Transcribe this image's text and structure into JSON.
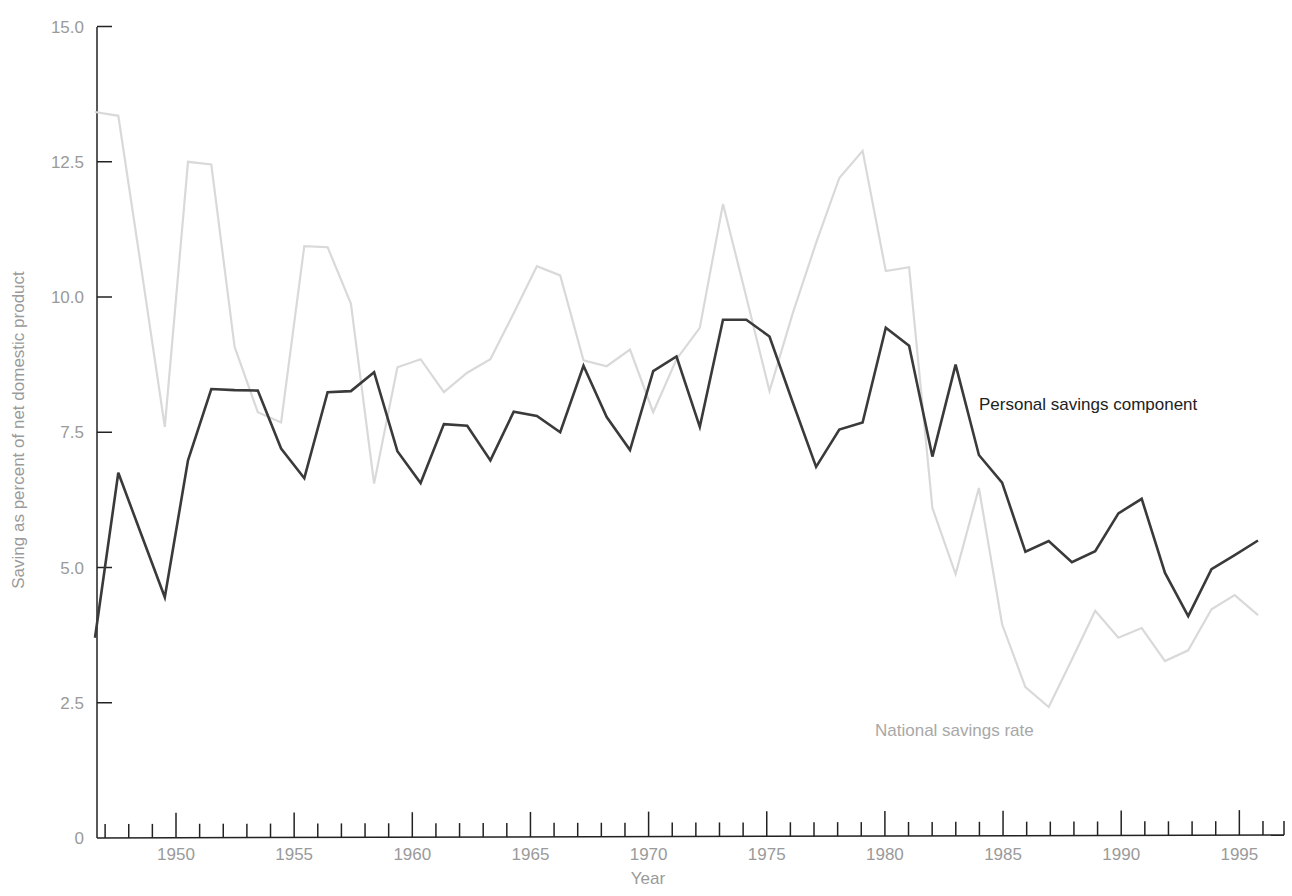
{
  "chart_data": {
    "type": "line",
    "title": "",
    "xlabel": "Year",
    "ylabel": "Saving as percent of net domestic product",
    "ylim": [
      0,
      15
    ],
    "xlim": [
      1946,
      1997
    ],
    "grid": false,
    "legend_position": "inline labels",
    "y_ticks": [
      "0",
      "2.5",
      "5.0",
      "7.5",
      "10.0",
      "12.5",
      "15.0"
    ],
    "y_tick_values": [
      0,
      2.5,
      5,
      7.5,
      10,
      12.5,
      15
    ],
    "x_tick_labels": [
      "1950",
      "1955",
      "1960",
      "1965",
      "1970",
      "1975",
      "1980",
      "1985",
      "1990",
      "1995"
    ],
    "x": [
      1946,
      1947,
      1948,
      1949,
      1950,
      1951,
      1952,
      1953,
      1954,
      1955,
      1956,
      1957,
      1958,
      1959,
      1960,
      1961,
      1962,
      1963,
      1964,
      1965,
      1966,
      1967,
      1968,
      1969,
      1970,
      1971,
      1972,
      1973,
      1974,
      1975,
      1976,
      1977,
      1978,
      1979,
      1980,
      1981,
      1982,
      1983,
      1984,
      1985,
      1986,
      1987,
      1988,
      1989,
      1990,
      1991,
      1992,
      1993,
      1994,
      1995,
      1996
    ],
    "series": [
      {
        "name": "Personal savings component",
        "color": "#3a3a3a",
        "values": [
          3.7,
          6.75,
          5.6,
          4.45,
          6.98,
          8.3,
          8.28,
          8.27,
          7.2,
          6.65,
          8.24,
          8.26,
          8.61,
          7.15,
          6.56,
          7.65,
          7.62,
          6.98,
          7.88,
          7.8,
          7.5,
          8.73,
          7.78,
          7.17,
          8.63,
          8.9,
          7.6,
          9.58,
          9.58,
          9.27,
          8.05,
          6.86,
          7.55,
          7.68,
          9.43,
          9.1,
          7.05,
          8.75,
          7.08,
          6.57,
          5.29,
          5.49,
          5.1,
          5.3,
          6.0,
          6.27,
          4.9,
          4.1,
          4.97,
          5.23,
          5.5
        ]
      },
      {
        "name": "National savings rate",
        "color": "#d9d9d9",
        "values": [
          13.42,
          13.35,
          10.5,
          7.6,
          12.5,
          12.45,
          9.08,
          7.87,
          7.68,
          10.94,
          10.92,
          9.88,
          6.55,
          8.7,
          8.85,
          8.24,
          8.6,
          8.85,
          9.7,
          10.57,
          10.4,
          8.83,
          8.72,
          9.03,
          7.87,
          8.85,
          9.43,
          11.72,
          10.0,
          8.26,
          9.7,
          11.0,
          12.2,
          12.7,
          10.48,
          10.55,
          6.1,
          4.88,
          6.47,
          3.95,
          2.79,
          2.42,
          3.3,
          4.2,
          3.7,
          3.88,
          3.27,
          3.47,
          4.23,
          4.49,
          4.12
        ]
      }
    ],
    "annotations": [
      {
        "text": "Personal savings component",
        "series": 0
      },
      {
        "text": "National savings rate",
        "series": 1
      }
    ]
  },
  "labels": {
    "personal": "Personal savings component",
    "national": "National savings rate",
    "xlabel": "Year",
    "ylabel": "Saving as percent of net domestic product"
  }
}
